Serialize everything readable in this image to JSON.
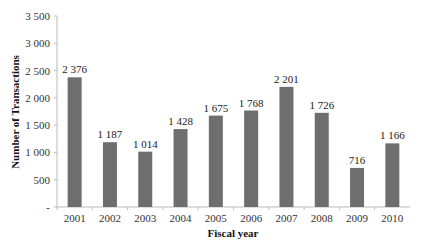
{
  "chart_data": {
    "type": "bar",
    "title": "",
    "xlabel": "Fiscal year",
    "ylabel": "Number of Transactions",
    "categories": [
      "2001",
      "2002",
      "2003",
      "2004",
      "2005",
      "2006",
      "2007",
      "2008",
      "2009",
      "2010"
    ],
    "values": [
      2376,
      1187,
      1014,
      1428,
      1675,
      1768,
      2201,
      1726,
      716,
      1166
    ],
    "value_labels": [
      "2 376",
      "1 187",
      "1 014",
      "1 428",
      "1 675",
      "1 768",
      "2 201",
      "1 726",
      "716",
      "1 166"
    ],
    "ylim": [
      0,
      3500
    ],
    "yticks": [
      0,
      500,
      1000,
      1500,
      2000,
      2500,
      3000,
      3500
    ],
    "ytick_labels": [
      "-",
      "500",
      "1 000",
      "1 500",
      "2 000",
      "2 500",
      "3 000",
      "3 500"
    ],
    "grid": false,
    "legend": null,
    "bar_color": "#6e6e6e"
  }
}
